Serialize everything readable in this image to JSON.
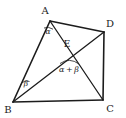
{
  "figure": {
    "background_color": "#ffffff",
    "stroke_color": "#1c1c1c"
  },
  "vertices": [
    {
      "id": "A",
      "label": "A",
      "x": 50,
      "y": 21,
      "label_x": 45,
      "label_y": 14
    },
    {
      "id": "B",
      "label": "B",
      "x": 13,
      "y": 102,
      "label_x": 6,
      "label_y": 111
    },
    {
      "id": "C",
      "label": "C",
      "x": 103,
      "y": 100,
      "label_x": 107,
      "label_y": 110
    },
    {
      "id": "D",
      "label": "D",
      "x": 104,
      "y": 32,
      "label_x": 108,
      "label_y": 27
    },
    {
      "id": "E",
      "label": "E",
      "x": 71,
      "y": 50,
      "label_x": 66,
      "label_y": 47
    }
  ],
  "edges": [
    {
      "name": "side-AB",
      "from": "A",
      "to": "B"
    },
    {
      "name": "side-BC",
      "from": "B",
      "to": "C"
    },
    {
      "name": "side-CD",
      "from": "C",
      "to": "D"
    },
    {
      "name": "side-DA",
      "from": "D",
      "to": "A"
    }
  ],
  "diagonals": [
    {
      "name": "diagonal-AC",
      "from": "A",
      "to": "C"
    },
    {
      "name": "diagonal-BD",
      "from": "B",
      "to": "D"
    }
  ],
  "angles": [
    {
      "id": "alpha-at-A",
      "label": "α",
      "vertex": "A",
      "label_x": 48,
      "label_y": 33,
      "arc_path": "M 44 28 Q 48.5 26.5 53 29"
    },
    {
      "id": "beta-at-B",
      "label": "β",
      "vertex": "B",
      "label_x": 26,
      "label_y": 85,
      "arc_path": "M 21 84 Q 24.5 79 29 81"
    },
    {
      "id": "alpha-plus-beta-at-E",
      "label": "α + β",
      "vertex": "E",
      "label_x": 60,
      "label_y": 70,
      "arc_path": "M 60 63 Q 69 57 79 64"
    }
  ]
}
